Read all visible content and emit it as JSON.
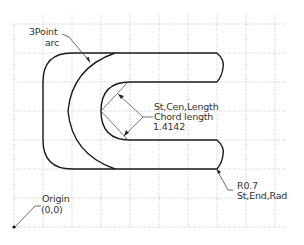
{
  "diagram": {
    "type": "cad-drawing",
    "grid": {
      "spacing_px": 29,
      "origin_px": [
        14,
        227
      ],
      "color": "#b8b8b8",
      "style": "dotted"
    },
    "shape_color": "#1a1a1a",
    "leader_color": "#444444",
    "annotations": {
      "three_point": {
        "line1": "3Point",
        "line2": "arc"
      },
      "st_cen": {
        "line1": "St,Cen,Length",
        "line2": "Chord  length",
        "line3": "1.4142"
      },
      "radius": {
        "line1": "R0.7",
        "line2": "St,End,Rad"
      },
      "origin": {
        "line1": "Origin",
        "line2": "(0,0)"
      }
    }
  }
}
